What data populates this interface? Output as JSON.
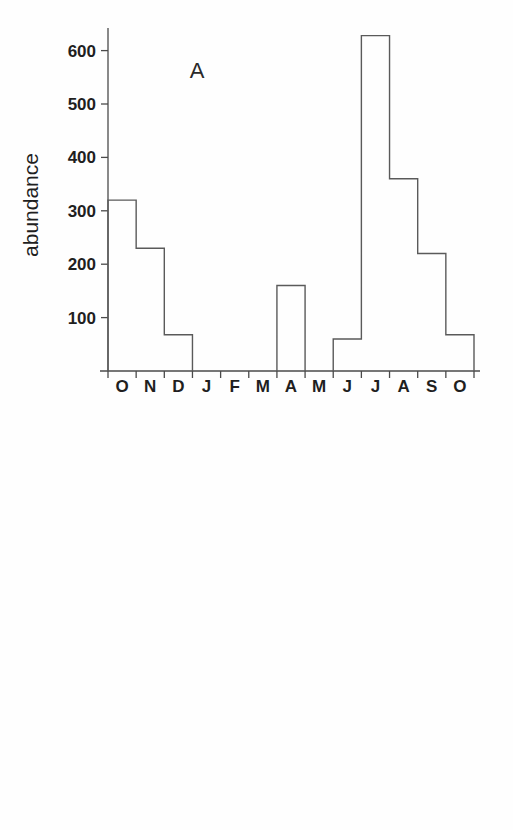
{
  "figure": {
    "background_color": "#fefefe",
    "line_color": "#5a5a5a",
    "axis_color": "#4a4a4a",
    "text_color": "#1f1f1f"
  },
  "panels": [
    {
      "letter": "A",
      "ylabel": "abundance",
      "ytick_labels": [
        "600",
        "500",
        "400",
        "300",
        "200",
        "100"
      ],
      "month_labels": [
        "O",
        "N",
        "D",
        "J",
        "F",
        "M",
        "A",
        "M",
        "J",
        "J",
        "A",
        "S",
        "O"
      ]
    },
    {
      "letter": "B",
      "ylabel": "abundance",
      "ytick_labels": [
        "600",
        "500",
        "400",
        "300",
        "200",
        "100"
      ],
      "month_labels": [
        "A",
        "M",
        "J",
        "J",
        "A",
        "S",
        "O",
        "N",
        "D",
        "J",
        "F",
        "M"
      ]
    }
  ],
  "chart_data": [
    {
      "type": "bar",
      "title": "A",
      "xlabel": "",
      "ylabel": "abundance",
      "categories": [
        "O",
        "N",
        "D",
        "J",
        "F",
        "M",
        "A",
        "M",
        "J",
        "J",
        "A",
        "S",
        "O"
      ],
      "values": [
        320,
        230,
        68,
        0,
        0,
        0,
        160,
        0,
        60,
        628,
        360,
        220,
        68
      ],
      "ylim": [
        0,
        660
      ],
      "yticks": [
        100,
        200,
        300,
        400,
        500,
        600
      ],
      "grid": false,
      "legend": "none",
      "style": "step-outline-histogram"
    },
    {
      "type": "bar",
      "title": "B",
      "xlabel": "",
      "ylabel": "abundance",
      "categories": [
        "A",
        "M",
        "J",
        "J",
        "A",
        "S",
        "O",
        "N",
        "D",
        "J",
        "F",
        "M"
      ],
      "values": [
        135,
        120,
        360,
        307,
        135,
        380,
        510,
        585,
        515,
        190,
        55,
        103
      ],
      "ylim": [
        0,
        620
      ],
      "yticks": [
        100,
        200,
        300,
        400,
        500,
        600
      ],
      "grid": false,
      "legend": "none",
      "style": "step-outline-histogram"
    }
  ]
}
